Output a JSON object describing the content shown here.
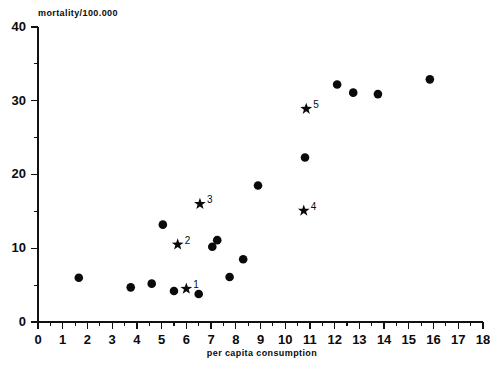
{
  "chart_data": {
    "type": "scatter",
    "title": "",
    "xlabel": "per capita consumption",
    "ylabel": "mortality/100.000",
    "xlim": [
      0,
      18
    ],
    "ylim": [
      0,
      40
    ],
    "x_ticks": [
      0,
      1,
      2,
      3,
      4,
      5,
      6,
      7,
      8,
      9,
      10,
      11,
      12,
      13,
      14,
      15,
      16,
      17,
      18
    ],
    "y_ticks": [
      0,
      10,
      20,
      30,
      40
    ],
    "y_minor_ticks": [
      5,
      15,
      25,
      35
    ],
    "grid": false,
    "legend": null,
    "series": [
      {
        "name": "data-points",
        "marker": "circle",
        "points": [
          {
            "x": 1.65,
            "y": 6.0
          },
          {
            "x": 3.75,
            "y": 4.7
          },
          {
            "x": 4.6,
            "y": 5.2
          },
          {
            "x": 5.05,
            "y": 13.2
          },
          {
            "x": 5.5,
            "y": 4.2
          },
          {
            "x": 6.5,
            "y": 3.8
          },
          {
            "x": 7.05,
            "y": 10.2
          },
          {
            "x": 7.25,
            "y": 11.1
          },
          {
            "x": 7.75,
            "y": 6.1
          },
          {
            "x": 8.3,
            "y": 8.5
          },
          {
            "x": 8.9,
            "y": 18.5
          },
          {
            "x": 10.8,
            "y": 22.3
          },
          {
            "x": 12.1,
            "y": 32.2
          },
          {
            "x": 12.75,
            "y": 31.1
          },
          {
            "x": 13.75,
            "y": 30.9
          },
          {
            "x": 15.85,
            "y": 32.9
          }
        ]
      },
      {
        "name": "labelled-points",
        "marker": "star",
        "points": [
          {
            "x": 6.0,
            "y": 4.5,
            "label": "1"
          },
          {
            "x": 5.65,
            "y": 10.5,
            "label": "2"
          },
          {
            "x": 6.55,
            "y": 16.0,
            "label": "3"
          },
          {
            "x": 10.75,
            "y": 15.1,
            "label": "4"
          },
          {
            "x": 10.85,
            "y": 28.9,
            "label": "5"
          }
        ]
      }
    ]
  },
  "colors": {
    "marker": "#0a0a0a",
    "axis": "#111111",
    "background": "#ffffff"
  }
}
